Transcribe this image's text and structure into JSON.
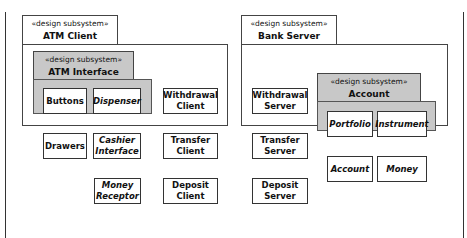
{
  "frame": {
    "left_border": true,
    "right_border": true
  },
  "packages": {
    "atm_client": {
      "stereotype": "«design subsystem»",
      "name": "ATM Client"
    },
    "atm_interface": {
      "stereotype": "«design subsystem»",
      "name": "ATM Interface"
    },
    "bank_server": {
      "stereotype": "«design subsystem»",
      "name": "Bank Server"
    },
    "account_management": {
      "stereotype": "«design subsystem»",
      "name": "Account Management"
    }
  },
  "classes": {
    "buttons": "Buttons",
    "dispenser": "Dispenser",
    "drawers": "Drawers",
    "cashier_interface": "Cashier Interface",
    "money_receptor": "Money Receptor",
    "withdrawal_client": "Withdrawal Client",
    "transfer_client": "Transfer Client",
    "deposit_client": "Deposit Client",
    "withdrawal_server": "Withdrawal Server",
    "transfer_server": "Transfer Server",
    "deposit_server": "Deposit Server",
    "portfolio": "Portfolio",
    "instrument": "Instrument",
    "account": "Account",
    "money": "Money"
  },
  "colors": {
    "package_gray": "#c8c8c8",
    "line": "#333333"
  }
}
